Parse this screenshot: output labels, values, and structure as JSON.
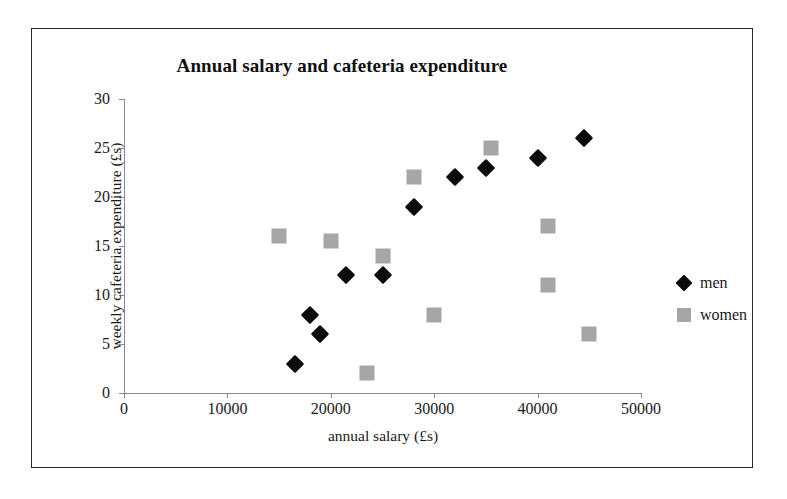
{
  "chart_data": {
    "type": "scatter",
    "title": "Annual salary and cafeteria expenditure",
    "xlabel": "annual salary (£s)",
    "ylabel": "weekly cafeteria expenditure (£s)",
    "xlim": [
      0,
      50000
    ],
    "ylim": [
      0,
      30
    ],
    "xticks": [
      0,
      10000,
      20000,
      30000,
      40000,
      50000
    ],
    "xtick_labels": [
      "0",
      "10000",
      "20000",
      "30000",
      "40000",
      "50000"
    ],
    "yticks": [
      0,
      5,
      10,
      15,
      20,
      25,
      30
    ],
    "ytick_labels": [
      "0",
      "5",
      "10",
      "15",
      "20",
      "25",
      "30"
    ],
    "grid": false,
    "legend_position": "right",
    "series": [
      {
        "name": "men",
        "marker": "diamond",
        "color": "#0b0b0b",
        "points": [
          [
            16500,
            3
          ],
          [
            18000,
            8
          ],
          [
            19000,
            6
          ],
          [
            21500,
            12
          ],
          [
            25000,
            12
          ],
          [
            28000,
            19
          ],
          [
            32000,
            22
          ],
          [
            35000,
            23
          ],
          [
            40000,
            24
          ],
          [
            44500,
            26
          ]
        ]
      },
      {
        "name": "women",
        "marker": "square",
        "color": "#a6a6a6",
        "points": [
          [
            15000,
            16
          ],
          [
            20000,
            15.5
          ],
          [
            23500,
            2
          ],
          [
            25000,
            14
          ],
          [
            28000,
            22
          ],
          [
            30000,
            8
          ],
          [
            35500,
            25
          ],
          [
            41000,
            17
          ],
          [
            41000,
            11
          ],
          [
            45000,
            6
          ]
        ]
      }
    ]
  },
  "legend": {
    "items": [
      {
        "label": "men",
        "marker": "diamond"
      },
      {
        "label": "women",
        "marker": "square"
      }
    ]
  }
}
